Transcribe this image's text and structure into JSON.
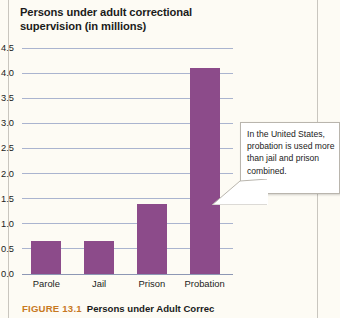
{
  "chart_data": {
    "type": "bar",
    "title": "Persons under adult correctional supervision (in millions)",
    "xlabel": "",
    "ylabel": "Persons under adult correctional supervision (in millions)",
    "categories": [
      "Parole",
      "Jail",
      "Prison",
      "Probation"
    ],
    "values": [
      0.65,
      0.65,
      1.4,
      4.1
    ],
    "ylim": [
      0.0,
      4.5
    ],
    "ytick_values": [
      0.0,
      0.5,
      1.0,
      1.5,
      2.0,
      2.5,
      3.0,
      3.5,
      4.0,
      4.5
    ],
    "ytick_labels": [
      "0.0",
      "0.5",
      "1.0",
      "1.5",
      "2.0",
      "2.5",
      "3.0",
      "3.5",
      "4.0",
      "4.5"
    ],
    "grid": true,
    "legend": false,
    "bar_color": "#8c4b8a",
    "gridline_color": "#aab4cf",
    "annotations": [
      {
        "text": "In the United States, probation is used more than jail and prison combined.",
        "points_to": "Probation"
      }
    ]
  },
  "callout": {
    "text": "In the United States, probation is used more than jail and prison combined."
  },
  "caption": {
    "number": "FIGURE 13.1",
    "title": "Persons under Adult Correc"
  }
}
